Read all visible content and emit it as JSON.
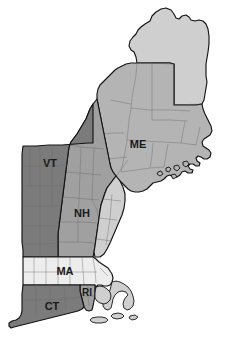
{
  "map": {
    "title": "New England States",
    "region": "New England",
    "background_color": "#ffffff",
    "projection_note": "state choropleth, grayscale shading",
    "width": 247,
    "height": 349,
    "outline_color": "#141414",
    "county_line_color": "#6a6a6a",
    "label_color": "#1a1a1a",
    "label_font_size": "11px"
  },
  "legend_shades": {
    "very_light": "#ededed",
    "light": "#cfcfcf",
    "medium": "#b4b4b4",
    "medium_dark": "#a0a0a0",
    "dark": "#7b7b7b"
  },
  "states": [
    {
      "code": "ME",
      "name": "Maine",
      "label": "ME",
      "fill": "#b4b4b4",
      "north_fill": "#cfcfcf",
      "label_x": 138,
      "label_y": 145
    },
    {
      "code": "VT",
      "name": "Vermont",
      "label": "VT",
      "fill": "#7b7b7b",
      "label_x": 50,
      "label_y": 164
    },
    {
      "code": "NH",
      "name": "New Hampshire",
      "label": "NH",
      "fill": "#a0a0a0",
      "label_x": 82,
      "label_y": 214
    },
    {
      "code": "MA",
      "name": "Massachusetts",
      "label": "MA",
      "fill": "#ededed",
      "label_x": 65,
      "label_y": 272
    },
    {
      "code": "CT",
      "name": "Connecticut",
      "label": "CT",
      "fill": "#7b7b7b",
      "label_x": 52,
      "label_y": 307
    },
    {
      "code": "RI",
      "name": "Rhode Island",
      "label": "RI",
      "fill": "#a0a0a0",
      "label_x": 87,
      "label_y": 293
    }
  ]
}
